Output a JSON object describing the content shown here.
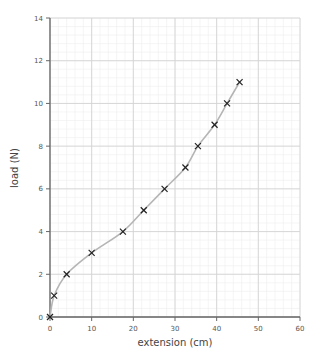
{
  "chart_data": {
    "type": "scatter",
    "title": "",
    "xlabel": "extension (cm)",
    "ylabel": "load (N)",
    "xlim": [
      0,
      60
    ],
    "ylim": [
      0,
      14
    ],
    "xticks": [
      0,
      10,
      20,
      30,
      40,
      50,
      60
    ],
    "yticks": [
      0,
      2,
      4,
      6,
      8,
      10,
      12,
      14
    ],
    "grid": true,
    "minor_grid": true,
    "marker": "x",
    "best_fit_curve": true,
    "legend": null,
    "points": [
      {
        "x": 0,
        "y": 0
      },
      {
        "x": 1,
        "y": 1
      },
      {
        "x": 4,
        "y": 2
      },
      {
        "x": 10,
        "y": 3
      },
      {
        "x": 17.5,
        "y": 4
      },
      {
        "x": 22.5,
        "y": 5
      },
      {
        "x": 27.5,
        "y": 6
      },
      {
        "x": 32.5,
        "y": 7
      },
      {
        "x": 35.5,
        "y": 8
      },
      {
        "x": 39.5,
        "y": 9
      },
      {
        "x": 42.5,
        "y": 10
      },
      {
        "x": 45.5,
        "y": 11
      }
    ]
  },
  "colors": {
    "major_grid": "#d4d4d4",
    "minor_grid": "#efefef",
    "axis": "#666666",
    "curve": "#b5b5b5",
    "marker": "#222222"
  }
}
